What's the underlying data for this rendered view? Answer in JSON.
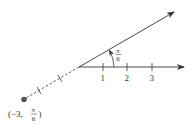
{
  "diagram": {
    "polar_axis": {
      "tick_labels": [
        "1",
        "2",
        "3"
      ]
    },
    "angle": {
      "numerator": "π",
      "denominator": "6"
    },
    "point": {
      "label_open": "(−3,",
      "numerator": "π",
      "denominator": "6",
      "label_close": ")",
      "r": -3,
      "theta": "π/6"
    },
    "colors": {
      "line": "#333333",
      "point": "#555555",
      "background": "#ffffff"
    }
  }
}
